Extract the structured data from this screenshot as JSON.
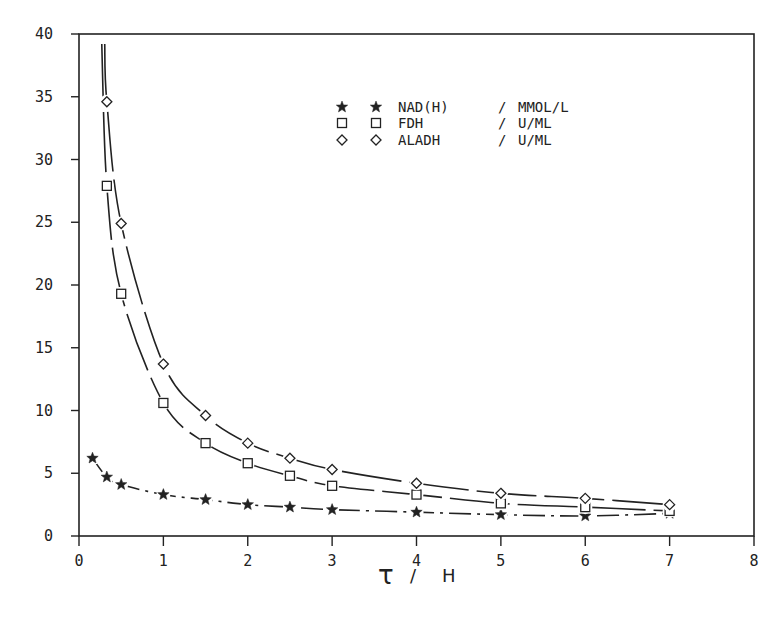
{
  "chart_data": {
    "type": "line",
    "title": "",
    "xlabel": "τ / H",
    "xlabel_parts": {
      "symbol": "τ",
      "slash": "/",
      "unit": "H"
    },
    "ylabel": "",
    "xlim": [
      0,
      8
    ],
    "ylim": [
      0,
      40
    ],
    "xticks": [
      0,
      1,
      2,
      3,
      4,
      5,
      6,
      7,
      8
    ],
    "yticks": [
      0,
      5,
      10,
      15,
      20,
      25,
      30,
      35,
      40
    ],
    "grid": false,
    "legend_position": "top-center",
    "series": [
      {
        "name": "NAD(H)",
        "unit": "MMOL/L",
        "marker": "star",
        "x": [
          0.16,
          0.33,
          0.5,
          1,
          1.5,
          2,
          2.5,
          3,
          4,
          5,
          6,
          7
        ],
        "y": [
          6.2,
          4.7,
          4.1,
          3.3,
          2.9,
          2.5,
          2.3,
          2.1,
          1.9,
          1.7,
          1.6,
          1.8
        ]
      },
      {
        "name": "FDH",
        "unit": "U/ML",
        "marker": "square",
        "x": [
          0.33,
          0.5,
          1,
          1.5,
          2,
          2.5,
          3,
          4,
          5,
          6,
          7
        ],
        "y": [
          27.9,
          19.3,
          10.6,
          7.4,
          5.8,
          4.8,
          4.0,
          3.3,
          2.6,
          2.3,
          2.0
        ]
      },
      {
        "name": "ALADH",
        "unit": "U/ML",
        "marker": "diamond",
        "x": [
          0.33,
          0.5,
          1,
          1.5,
          2,
          2.5,
          3,
          4,
          5,
          6,
          7
        ],
        "y": [
          34.6,
          24.9,
          13.7,
          9.6,
          7.4,
          6.2,
          5.3,
          4.2,
          3.4,
          3.0,
          2.5
        ]
      }
    ]
  },
  "legend": [
    {
      "name": "NAD(H)",
      "sep": "/",
      "unit": "MMOL/L"
    },
    {
      "name": "FDH",
      "sep": "/",
      "unit": "U/ML"
    },
    {
      "name": "ALADH",
      "sep": "/",
      "unit": "U/ML"
    }
  ]
}
